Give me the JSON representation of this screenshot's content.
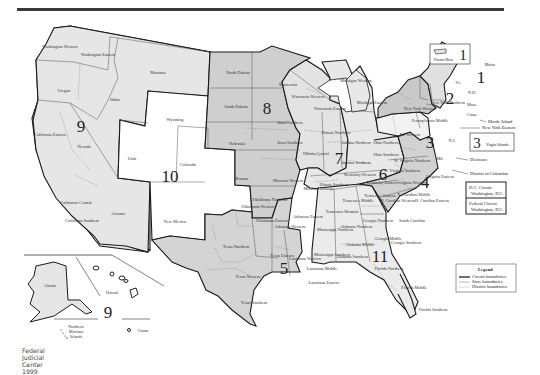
{
  "credit": "Federal Judicial Center 1999",
  "circuits": [
    {
      "number": "1",
      "states": [
        "Maine",
        "N.H.",
        "Mass.",
        "Rhode Island",
        "Puerto Rico"
      ]
    },
    {
      "number": "2",
      "states": [
        "Vt.",
        "New York Northern",
        "New York Western",
        "New York Eastern",
        "Conn."
      ]
    },
    {
      "number": "3",
      "states": [
        "Pennsylvania Middle",
        "Pa. Western",
        "N.J.",
        "Delaware",
        "Virgin Islands"
      ]
    },
    {
      "number": "4",
      "states": [
        "Md.",
        "West Virginia Northern",
        "W. Virginia Southern",
        "Virginia Eastern",
        "Virginia Western",
        "N. Carolina Western",
        "N. Carolina Middle",
        "N. Carolina Eastern",
        "South Carolina"
      ]
    },
    {
      "number": "5",
      "states": [
        "Texas Northern",
        "Texas Western",
        "Texas Eastern",
        "Texas Southern",
        "Louisiana Western",
        "Louisiana Middle",
        "Louisiana Eastern",
        "Mississippi Northern",
        "Mississippi Southern"
      ]
    },
    {
      "number": "6",
      "states": [
        "Michigan Western",
        "Michigan Eastern",
        "Ohio Northern",
        "Ohio Southern",
        "Kentucky Eastern",
        "Kentucky Western",
        "Tennessee Western",
        "Tennessee Middle",
        "Tennessee Eastern"
      ]
    },
    {
      "number": "7",
      "states": [
        "Wisconsin Western",
        "Wisconsin Eastern",
        "Illinois Northern",
        "Illinois Central",
        "Illinois Southern",
        "Indiana Northern",
        "Indiana Southern"
      ]
    },
    {
      "number": "8",
      "states": [
        "North Dakota",
        "South Dakota",
        "Nebraska",
        "Minnesota",
        "Iowa Northern",
        "Iowa Southern",
        "Missouri Western",
        "Missouri Eastern",
        "Arkansas Western",
        "Arkansas Eastern"
      ]
    },
    {
      "number": "9",
      "states": [
        "Washington Western",
        "Washington Eastern",
        "Oregon",
        "Idaho",
        "Montana",
        "Nevada",
        "California Northern",
        "California Eastern",
        "California Central",
        "California Southern",
        "Arizona",
        "Alaska",
        "Hawaii",
        "Northern Mariana Islands",
        "Guam"
      ]
    },
    {
      "number": "10",
      "states": [
        "Wyoming",
        "Utah",
        "Colorado",
        "Kansas",
        "New Mexico",
        "Oklahoma Western",
        "Oklahoma Northern",
        "Oklahoma Eastern"
      ]
    },
    {
      "number": "11",
      "states": [
        "Alabama Northern",
        "Alabama Middle",
        "Alabama Southern",
        "Georgia Northern",
        "Georgia Middle",
        "Georgia Southern",
        "Florida Northern",
        "Florida Middle",
        "Florida Southern"
      ]
    }
  ],
  "labels": {
    "wa_w": "Washington Western",
    "wa_e": "Washington Eastern",
    "oregon": "Oregon",
    "idaho": "Idaho",
    "montana": "Montana",
    "nevada": "Nevada",
    "ca_e": "California Eastern",
    "ca_c": "California Central",
    "ca_s": "California Southern",
    "arizona": "Arizona",
    "wyoming": "Wyoming",
    "utah": "Utah",
    "colorado": "Colorado",
    "new_mexico": "New Mexico",
    "kansas": "Kansas",
    "nd": "North Dakota",
    "sd": "South Dakota",
    "nebraska": "Nebraska",
    "minnesota": "Minnesota",
    "ia_n": "Iowa Northern",
    "ia_s": "Iowa Southern",
    "mo_w": "Missouri Western",
    "mo_e": "Missouri Eastern",
    "ok_w": "Oklahoma Western",
    "ok_n": "Oklahoma Northern",
    "ok_e": "Oklahoma Eastern",
    "ar_w": "Arkansas Western",
    "ar_e": "Arkansas Eastern",
    "tx_n": "Texas Northern",
    "tx_w": "Texas Western",
    "tx_e": "Texas Eastern",
    "tx_s": "Texas Southern",
    "la_w": "Louisiana Western",
    "la_m": "Louisiana Middle",
    "la_e": "Louisiana Eastern",
    "ms_n": "Mississippi Northern",
    "ms_s": "Mississippi Southern",
    "wi_w": "Wisconsin Western",
    "wi_e": "Wisconsin Eastern",
    "il_n": "Illinois Northern",
    "il_c": "Illinois Central",
    "il_s": "Illinois Southern",
    "in_n": "Indiana Northern",
    "in_s": "Indiana Southern",
    "mi_w": "Michigan Western",
    "mi_e": "Michigan Eastern",
    "oh_n": "Ohio Northern",
    "oh_s": "Ohio Southern",
    "ky_e": "Kentucky Eastern",
    "ky_w": "Kentucky Western",
    "tn_w": "Tennessee Western",
    "tn_m": "Tennessee Middle",
    "tn_e": "Tennessee Eastern",
    "al_n": "Alabama Northern",
    "al_m": "Alabama Middle",
    "al_s": "Alabama Southern",
    "ga_n": "Georgia Northern",
    "ga_m": "Georgia Middle",
    "ga_s": "Georgia Southern",
    "fl_n": "Florida Northern",
    "fl_m": "Florida Middle",
    "fl_s": "Florida Southern",
    "sc": "South Carolina",
    "nc_w": "N. Carolina Western",
    "nc_m": "N. Carolina Middle",
    "nc_e": "N. Carolina Eastern",
    "va_e": "Virginia Eastern",
    "va_w": "Virginia Western",
    "wv_n": "W. Virginia Northern",
    "wv_s": "W. Virginia Southern",
    "md": "Md.",
    "pa_w": "Pa. Western",
    "pa_m": "Pennsylvania Middle",
    "nj": "N.J.",
    "ny_w": "New York Western",
    "ny_n": "New York Northern",
    "vt": "Vt.",
    "nh": "N.H.",
    "mass": "Mass.",
    "conn": "Conn.",
    "maine": "Maine",
    "alaska": "Alaska",
    "hawaii": "Hawaii",
    "nmi_1": "Northern",
    "nmi_2": "Mariana",
    "nmi_3": "Islands",
    "guam": "Guam"
  },
  "callouts": {
    "rhode_island": "Rhode Island",
    "ny_eastern": "New York Eastern",
    "delaware": "Delaware",
    "dc": "District of Columbia"
  },
  "insets": {
    "puerto_rico": {
      "label": "Puerto Rico",
      "circuit": "1"
    },
    "virgin_islands": {
      "label": "Virgin Islands",
      "circuit": "3"
    },
    "dc_circuit": {
      "line1": "D.C. Circuit",
      "line2": "Washington, D.C."
    },
    "federal_circuit": {
      "line1": "Federal Circuit",
      "line2": "Washington, D.C."
    }
  },
  "legend": {
    "title": "Legend",
    "items": [
      {
        "label": "Circuit boundaries",
        "style": "thick"
      },
      {
        "label": "State boundaries",
        "style": "thin"
      },
      {
        "label": "District boundaries",
        "style": "dashed"
      }
    ]
  },
  "colors": {
    "circuit_border": "#1a1a1a",
    "top_rule": "#3a3a3a",
    "background": "#ffffff"
  }
}
